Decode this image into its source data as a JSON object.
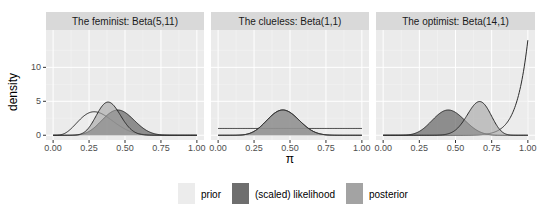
{
  "chart_data": {
    "type": "area",
    "title": "",
    "xlabel": "π",
    "ylabel": "density",
    "xlim": [
      0,
      1
    ],
    "ylim": [
      -0.7,
      15.5
    ],
    "x_ticks": [
      "0.00",
      "0.25",
      "0.50",
      "0.75",
      "1.00"
    ],
    "x_tick_values": [
      0,
      0.25,
      0.5,
      0.75,
      1
    ],
    "y_ticks": [
      "0",
      "5",
      "10"
    ],
    "y_tick_values": [
      0,
      5,
      10
    ],
    "grid": true,
    "legend_position": "bottom",
    "legend": [
      {
        "name": "prior",
        "color": "#ececec"
      },
      {
        "name": "(scaled) likelihood",
        "color": "#6e6e6e"
      },
      {
        "name": "posterior",
        "color": "#a3a3a3"
      }
    ],
    "observed_data": {
      "y": 9,
      "n": 20
    },
    "panels": [
      {
        "strip_label": "The feminist: Beta(5,11)",
        "series": [
          {
            "name": "prior",
            "dist": "beta",
            "alpha": 5,
            "beta": 11
          },
          {
            "name": "(scaled) likelihood",
            "dist": "beta",
            "alpha": 10,
            "beta": 12
          },
          {
            "name": "posterior",
            "dist": "beta",
            "alpha": 14,
            "beta": 22
          }
        ]
      },
      {
        "strip_label": "The clueless: Beta(1,1)",
        "series": [
          {
            "name": "prior",
            "dist": "beta",
            "alpha": 1,
            "beta": 1
          },
          {
            "name": "(scaled) likelihood",
            "dist": "beta",
            "alpha": 10,
            "beta": 12
          },
          {
            "name": "posterior",
            "dist": "beta",
            "alpha": 10,
            "beta": 12
          }
        ]
      },
      {
        "strip_label": "The optimist: Beta(14,1)",
        "series": [
          {
            "name": "prior",
            "dist": "beta",
            "alpha": 14,
            "beta": 1
          },
          {
            "name": "(scaled) likelihood",
            "dist": "beta",
            "alpha": 10,
            "beta": 12
          },
          {
            "name": "posterior",
            "dist": "beta",
            "alpha": 23,
            "beta": 12
          }
        ]
      }
    ]
  },
  "colors": {
    "panel_bg": "#ebebeb",
    "strip_bg": "#d9d9d9",
    "grid_major": "#ffffff",
    "grid_minor": "#f4f4f4",
    "line": "#2b2b2b"
  }
}
